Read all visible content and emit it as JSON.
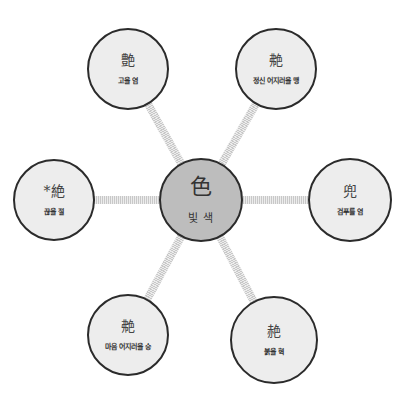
{
  "diagram": {
    "type": "radial-concept-map",
    "colors": {
      "center_fill": "#bdbdbd",
      "node_fill": "#ededed",
      "border": "#2b2b2b",
      "connector": "#c8c8c8"
    },
    "center": {
      "hanja": "色",
      "meaning": "빛 색",
      "x": 201,
      "y": 200,
      "r": 42
    },
    "nodes": [
      {
        "position": "top-left",
        "hanja": "艶",
        "meaning": "고울 염",
        "x": 128,
        "y": 69,
        "r": 41
      },
      {
        "position": "top-right",
        "hanja": "艴",
        "meaning": "정신 어지러울 맹",
        "x": 276,
        "y": 69,
        "r": 41
      },
      {
        "position": "left",
        "hanja": "*絶",
        "meaning": "끊을 절",
        "x": 54,
        "y": 200,
        "r": 41
      },
      {
        "position": "right",
        "hanja": "兜",
        "meaning": "검푸를 염",
        "x": 350,
        "y": 200,
        "r": 42
      },
      {
        "position": "bottom-left",
        "hanja": "艴",
        "meaning": "마음 어지러울 승",
        "x": 128,
        "y": 335,
        "r": 41
      },
      {
        "position": "bottom-right",
        "hanja": "赩",
        "meaning": "붉을 혁",
        "x": 274,
        "y": 340,
        "r": 44
      }
    ]
  }
}
